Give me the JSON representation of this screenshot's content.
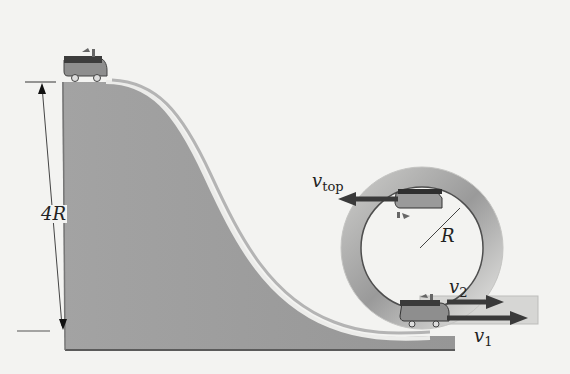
{
  "diagram": {
    "colors": {
      "background": "#f3f3f1",
      "slope_fill": "#9c9c9c",
      "track_highlight": "#e9e9e6",
      "loop_ring": "#a8a8a8",
      "loop_inner_edge": "#555555",
      "arrow": "#3a3a3a",
      "car_body": "#8e8e8e",
      "car_top": "#3c3c3c",
      "text": "#222222"
    },
    "labels": {
      "height": {
        "main": "4R",
        "sub": ""
      },
      "radius": {
        "main": "R",
        "sub": ""
      },
      "v_top": {
        "main": "v",
        "sub": "top"
      },
      "v2": {
        "main": "v",
        "sub": "2"
      },
      "v1": {
        "main": "v",
        "sub": "1"
      }
    },
    "elements": {
      "height_dimension": "4R",
      "loop_radius": "R",
      "velocity_vectors": [
        "v_top",
        "v_2",
        "v_1"
      ],
      "cars": [
        "car-at-start",
        "car-at-loop-top",
        "car-at-loop-bottom"
      ]
    }
  }
}
